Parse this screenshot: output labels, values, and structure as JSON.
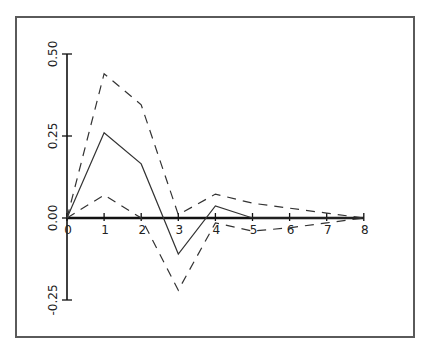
{
  "chart_data": {
    "type": "line",
    "title": "",
    "xlabel": "",
    "ylabel": "",
    "x": [
      0,
      1,
      2,
      3,
      4,
      5,
      6,
      7,
      8
    ],
    "x_ticks": [
      "0",
      "1",
      "2",
      "3",
      "4",
      "5",
      "6",
      "7",
      "8"
    ],
    "y_ticks": [
      "-0.25",
      "0.00",
      "0.25",
      "0.50"
    ],
    "y_tick_values": [
      -0.25,
      0.0,
      0.25,
      0.5
    ],
    "xlim": [
      0,
      8
    ],
    "ylim": [
      -0.25,
      0.5
    ],
    "grid": false,
    "legend": null,
    "series": [
      {
        "name": "estimate",
        "style": "solid",
        "values": [
          0.0,
          0.26,
          0.165,
          -0.11,
          0.037,
          0.0,
          0.0,
          0.0,
          0.0
        ]
      },
      {
        "name": "upper bound",
        "style": "dashed",
        "values": [
          0.0,
          0.44,
          0.345,
          0.01,
          0.073,
          0.045,
          0.03,
          0.015,
          0.0
        ]
      },
      {
        "name": "lower bound",
        "style": "dashed",
        "values": [
          0.0,
          0.07,
          0.0,
          -0.22,
          -0.015,
          -0.04,
          -0.03,
          -0.015,
          0.0
        ]
      }
    ]
  }
}
